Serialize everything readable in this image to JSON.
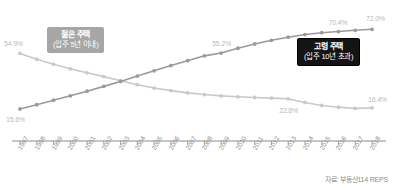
{
  "chart_data": {
    "type": "line",
    "title": "",
    "xlabel": "",
    "ylabel": "",
    "ylim": [
      0,
      80
    ],
    "grid": false,
    "legend_position": "inline-callout",
    "categories": [
      "1997",
      "1998",
      "1999",
      "2000",
      "2001",
      "2002",
      "2003",
      "2004",
      "2005",
      "2006",
      "2007",
      "2008",
      "2009",
      "2010",
      "2011",
      "2012",
      "2013",
      "2014",
      "2015",
      "2016",
      "2017",
      "2018"
    ],
    "series": [
      {
        "name": "젊은 주택 (입주 5년 이내)",
        "color": "#c9c9c9",
        "values": [
          54.9,
          50.8,
          47.2,
          44.0,
          41.2,
          38.5,
          35.6,
          32.8,
          30.4,
          28.6,
          27.0,
          25.8,
          24.9,
          24.2,
          23.7,
          23.3,
          22.8,
          20.2,
          18.1,
          16.8,
          16.0,
          16.4
        ]
      },
      {
        "name": "고령 주택 (입주 10년 초과)",
        "color": "#9a9a9a",
        "values": [
          15.6,
          18.6,
          21.8,
          24.9,
          28.2,
          31.6,
          35.1,
          38.9,
          42.6,
          46.3,
          49.8,
          53.2,
          55.2,
          58.6,
          61.6,
          64.2,
          66.4,
          68.3,
          69.6,
          70.4,
          71.3,
          72.0
        ]
      }
    ],
    "annotations": [
      {
        "text": "54.9%",
        "series": "젊은 주택 (입주 5년 이내)",
        "category": "1997"
      },
      {
        "text": "22.8%",
        "series": "젊은 주택 (입주 5년 이내)",
        "category": "2013"
      },
      {
        "text": "16.4%",
        "series": "젊은 주택 (입주 5년 이내)",
        "category": "2018"
      },
      {
        "text": "15.6%",
        "series": "고령 주택 (입주 10년 초과)",
        "category": "1997"
      },
      {
        "text": "55.2%",
        "series": "고령 주택 (입주 10년 초과)",
        "category": "2009"
      },
      {
        "text": "70.4%",
        "series": "고령 주택 (입주 10년 초과)",
        "category": "2016"
      },
      {
        "text": "72.0%",
        "series": "고령 주택 (입주 10년 초과)",
        "category": "2018"
      }
    ]
  },
  "callouts": {
    "young": {
      "line1": "젊은 주택",
      "line2": "(입주 5년 이내)"
    },
    "old": {
      "line1": "고령 주택",
      "line2": "(입주 10년 초과)"
    }
  },
  "source": {
    "text": "자료: 부동산114 REPS"
  },
  "colors": {
    "young_line": "#c9c9c9",
    "old_line": "#9a9a9a",
    "axis": "#808080",
    "label_text": "#b9b9b9",
    "tick_text": "#8d8d8d",
    "callout_young_bg": "#a6a6a6",
    "callout_old_bg": "#141414"
  }
}
